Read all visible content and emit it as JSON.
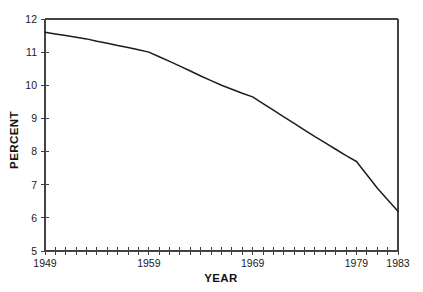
{
  "chart_data": {
    "type": "line",
    "title": "",
    "xlabel": "YEAR",
    "ylabel": "PERCENT",
    "xlim": [
      1949,
      1983
    ],
    "ylim": [
      5,
      12
    ],
    "grid": false,
    "legend": null,
    "x_tick_labels": [
      "1949",
      "1959",
      "1969",
      "1979",
      "1983"
    ],
    "x_labeled_ticks": [
      1949,
      1959,
      1969,
      1979,
      1983
    ],
    "x_minor_tick_interval": 1,
    "y_tick_labels": [
      "5",
      "6",
      "7",
      "8",
      "9",
      "10",
      "11",
      "12"
    ],
    "y_ticks": [
      5,
      6,
      7,
      8,
      9,
      10,
      11,
      12
    ],
    "x": [
      1949,
      1950,
      1951,
      1952,
      1953,
      1954,
      1955,
      1956,
      1957,
      1958,
      1959,
      1960,
      1961,
      1962,
      1963,
      1964,
      1965,
      1966,
      1967,
      1968,
      1969,
      1970,
      1971,
      1972,
      1973,
      1974,
      1975,
      1976,
      1977,
      1978,
      1979,
      1980,
      1981,
      1982,
      1983
    ],
    "values": [
      11.6,
      11.55,
      11.5,
      11.45,
      11.4,
      11.33,
      11.27,
      11.2,
      11.14,
      11.07,
      11.0,
      10.86,
      10.72,
      10.58,
      10.43,
      10.28,
      10.14,
      10.0,
      9.88,
      9.76,
      9.65,
      9.45,
      9.25,
      9.05,
      8.85,
      8.65,
      8.45,
      8.26,
      8.07,
      7.88,
      7.7,
      7.3,
      6.9,
      6.55,
      6.2
    ],
    "series": [
      {
        "name": "percent",
        "values": [
          11.6,
          11.55,
          11.5,
          11.45,
          11.4,
          11.33,
          11.27,
          11.2,
          11.14,
          11.07,
          11.0,
          10.86,
          10.72,
          10.58,
          10.43,
          10.28,
          10.14,
          10.0,
          9.88,
          9.76,
          9.65,
          9.45,
          9.25,
          9.05,
          8.85,
          8.65,
          8.45,
          8.26,
          8.07,
          7.88,
          7.7,
          7.3,
          6.9,
          6.55,
          6.2
        ],
        "color": "#1d1d1d"
      }
    ],
    "annotations": []
  },
  "colors": {
    "line": "#1d1d1d",
    "axis": "#444444",
    "text": "#1a1a1a",
    "background": "#ffffff"
  }
}
